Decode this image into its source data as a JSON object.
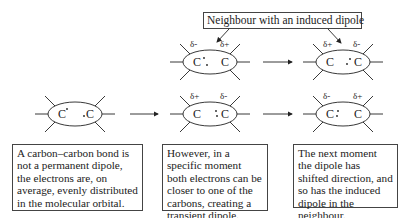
{
  "title_label": "Neighbour with an induced dipole",
  "molecules": {
    "neutral": {
      "left_atom": "C",
      "right_atom": "C"
    },
    "transient": {
      "left_atom": "C",
      "right_atom": "C",
      "left_charge": "δ+",
      "right_charge": "δ-"
    },
    "shifted": {
      "left_atom": "C",
      "right_atom": "C",
      "left_charge": "δ-",
      "right_charge": "δ+"
    },
    "neighbour_1": {
      "left_atom": "C",
      "right_atom": "C",
      "left_charge": "δ-",
      "right_charge": "δ+"
    },
    "neighbour_2": {
      "left_atom": "C",
      "right_atom": "C",
      "left_charge": "δ+",
      "right_charge": "δ-"
    }
  },
  "captions": [
    "A carbon–carbon bond is not a permanent dipole, the electrons are, on average, evenly distributed in the molecular orbital.",
    "However, in a specific moment both electrons can be closer to one of the carbons, creating a transient dipole.",
    "The next moment the dipole has shifted direction, and so has the induced dipole in the neighbour."
  ]
}
